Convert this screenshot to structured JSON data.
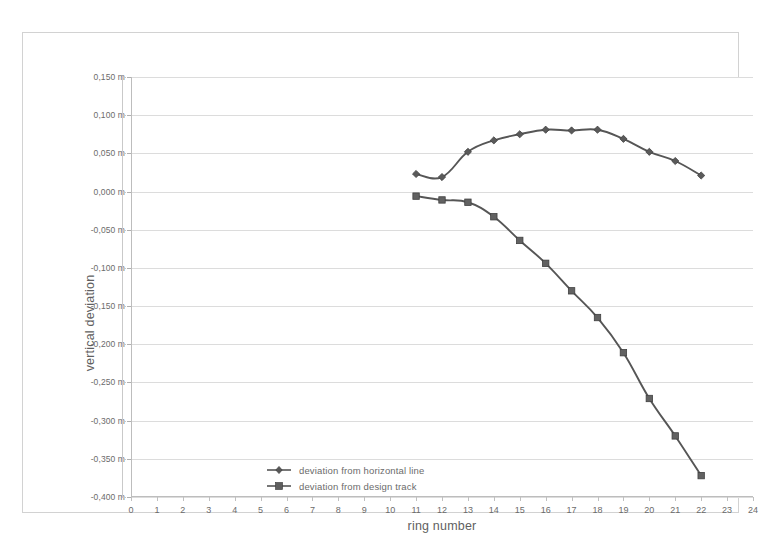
{
  "chart_data": {
    "type": "line",
    "title": "",
    "xlabel": "ring number",
    "ylabel": "vertical deviation",
    "xlim": [
      0,
      24
    ],
    "ylim": [
      -0.4,
      0.15
    ],
    "grid": true,
    "legend_position": "inside-lower-left",
    "x_tick_labels": [
      "0",
      "1",
      "2",
      "3",
      "4",
      "5",
      "6",
      "7",
      "8",
      "9",
      "10",
      "11",
      "12",
      "13",
      "14",
      "15",
      "16",
      "17",
      "18",
      "19",
      "20",
      "21",
      "22",
      "23",
      "24"
    ],
    "x_ticks": [
      0,
      1,
      2,
      3,
      4,
      5,
      6,
      7,
      8,
      9,
      10,
      11,
      12,
      13,
      14,
      15,
      16,
      17,
      18,
      19,
      20,
      21,
      22,
      23,
      24
    ],
    "y_ticks": [
      0.15,
      0.1,
      0.05,
      0.0,
      -0.05,
      -0.1,
      -0.15,
      -0.2,
      -0.25,
      -0.3,
      -0.35,
      -0.4
    ],
    "y_tick_labels": [
      "0,150 m",
      "0,100 m",
      "0,050 m",
      "0,000 m",
      "-0,050 m",
      "-0,100 m",
      "-0,150 m",
      "-0,200 m",
      "-0,250 m",
      "-0,300 m",
      "-0,350 m",
      "-0,400 m"
    ],
    "series": [
      {
        "name": "deviation from horizontal line",
        "marker": "diamond",
        "color": "#565656",
        "x": [
          11,
          12,
          13,
          14,
          15,
          16,
          17,
          18,
          19,
          20,
          21,
          22
        ],
        "values": [
          0.023,
          0.019,
          0.052,
          0.067,
          0.075,
          0.081,
          0.08,
          0.081,
          0.069,
          0.052,
          0.04,
          0.021
        ]
      },
      {
        "name": "deviation from design track",
        "marker": "square",
        "color": "#565656",
        "x": [
          11,
          12,
          13,
          14,
          15,
          16,
          17,
          18,
          19,
          20,
          21,
          22
        ],
        "values": [
          -0.006,
          -0.011,
          -0.014,
          -0.033,
          -0.064,
          -0.094,
          -0.13,
          -0.165,
          -0.211,
          -0.271,
          -0.32,
          -0.372
        ]
      }
    ]
  },
  "legend": {
    "items": [
      {
        "label": "deviation from horizontal line"
      },
      {
        "label": "deviation from design track"
      }
    ]
  }
}
